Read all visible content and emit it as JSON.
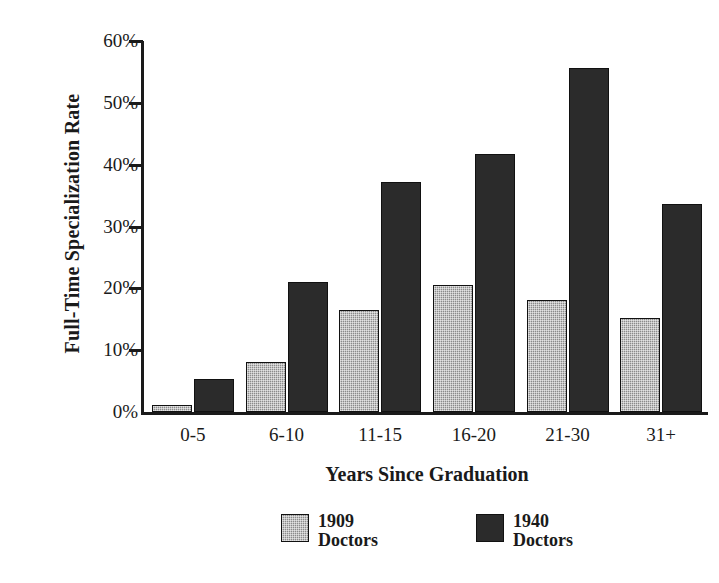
{
  "chart_data": {
    "type": "bar",
    "title": "",
    "xlabel": "Years Since Graduation",
    "ylabel": "Full-Time Specialization Rate",
    "categories": [
      "0-5",
      "6-10",
      "11-15",
      "16-20",
      "21-30",
      "31+"
    ],
    "series": [
      {
        "name": "1909 Doctors",
        "color": "#8b8b8b",
        "values": [
          1.2,
          8.1,
          16.5,
          20.6,
          18.1,
          15.2
        ]
      },
      {
        "name": "1940 Doctors",
        "color": "#2b2b2b",
        "values": [
          5.3,
          21.0,
          37.2,
          41.7,
          55.6,
          33.6
        ]
      }
    ],
    "ylim": [
      0,
      60
    ],
    "ytick_values": [
      0,
      10,
      20,
      30,
      40,
      50,
      60
    ],
    "ytick_labels": [
      "0%",
      "10%",
      "20%",
      "30%",
      "40%",
      "50%",
      "60%"
    ],
    "grid": false,
    "legend_position": "bottom",
    "legend_entries": [
      {
        "label_line1": "1909",
        "label_line2": "Doctors"
      },
      {
        "label_line1": "1940",
        "label_line2": "Doctors"
      }
    ]
  }
}
